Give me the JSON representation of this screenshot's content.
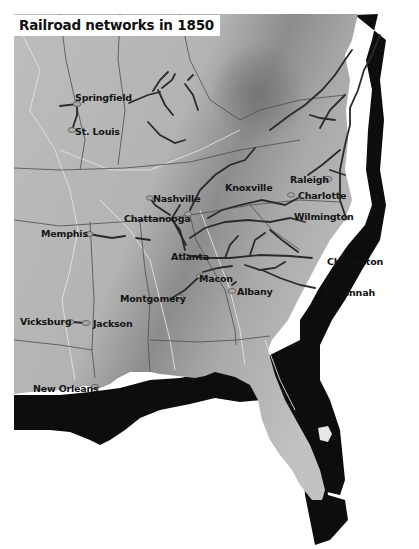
{
  "map": {
    "title": "Railroad networks in 1850",
    "colors": {
      "land": "#b9b9b9",
      "land_dark": "#8a8a8a",
      "ocean_shadow": "#0d0d0d",
      "railroad": "#2b2b2b",
      "state_border": "#4a4a4a",
      "river": "#e6e6e6",
      "city_marker": "#a0a0a0"
    },
    "cities": [
      {
        "name": "Springfield",
        "x": 75,
        "y": 92
      },
      {
        "name": "St. Louis",
        "x": 75,
        "y": 127
      },
      {
        "name": "Nashville",
        "x": 153,
        "y": 197
      },
      {
        "name": "Chattanooga",
        "x": 124,
        "y": 215
      },
      {
        "name": "Knoxville",
        "x": 225,
        "y": 185
      },
      {
        "name": "Raleigh",
        "x": 290,
        "y": 177
      },
      {
        "name": "Charlotte",
        "x": 298,
        "y": 195
      },
      {
        "name": "Wilmington",
        "x": 294,
        "y": 215
      },
      {
        "name": "Memphis",
        "x": 41,
        "y": 230
      },
      {
        "name": "Atlanta",
        "x": 171,
        "y": 253
      },
      {
        "name": "Macon",
        "x": 199,
        "y": 275
      },
      {
        "name": "Albany",
        "x": 237,
        "y": 287
      },
      {
        "name": "Montgomery",
        "x": 120,
        "y": 294
      },
      {
        "name": "Charleston",
        "x": 327,
        "y": 257
      },
      {
        "name": "Savannah",
        "x": 324,
        "y": 290
      },
      {
        "name": "Vicksburg",
        "x": 20,
        "y": 318
      },
      {
        "name": "Jackson",
        "x": 93,
        "y": 319
      },
      {
        "name": "New Orleans",
        "x": 33,
        "y": 386
      }
    ]
  }
}
